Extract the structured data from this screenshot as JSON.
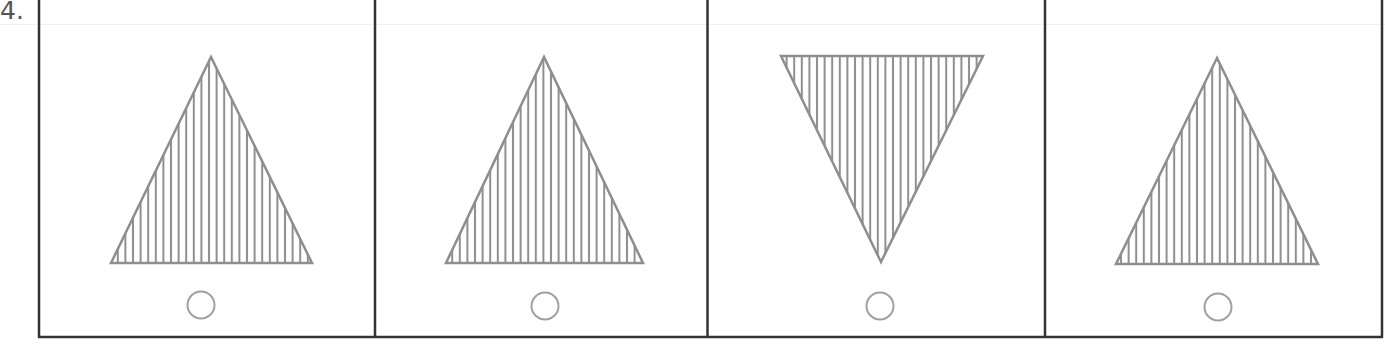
{
  "question": {
    "number_label": "4."
  },
  "colors": {
    "border": "#333333",
    "shape_stroke": "#8e8e8e",
    "circle_stroke": "#a0a0a0",
    "background": "#ffffff"
  },
  "options": [
    {
      "index": 1,
      "shape": "triangle-up",
      "fill": "vertical-stripes",
      "selected": false
    },
    {
      "index": 2,
      "shape": "triangle-up",
      "fill": "vertical-stripes",
      "selected": false
    },
    {
      "index": 3,
      "shape": "triangle-down",
      "fill": "vertical-stripes",
      "selected": false
    },
    {
      "index": 4,
      "shape": "triangle-up",
      "fill": "vertical-stripes",
      "selected": false
    }
  ]
}
